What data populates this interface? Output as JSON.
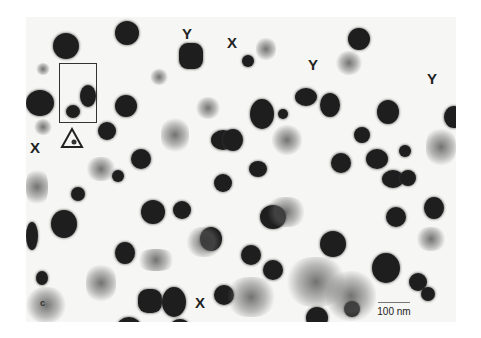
{
  "figure": {
    "panel_label": "c",
    "labels": [
      {
        "text": "Y",
        "x": 182,
        "y": 26
      },
      {
        "text": "X",
        "x": 227,
        "y": 37
      },
      {
        "text": "Y",
        "x": 308,
        "y": 58
      },
      {
        "text": "Y",
        "x": 428,
        "y": 72
      },
      {
        "text": "X",
        "x": 30,
        "y": 141
      },
      {
        "text": "X",
        "x": 195,
        "y": 296
      }
    ],
    "scale_bar": {
      "label": "100 nm"
    },
    "colors": {
      "particle": "#1e1e1e",
      "background": "#f6f6f4"
    }
  }
}
